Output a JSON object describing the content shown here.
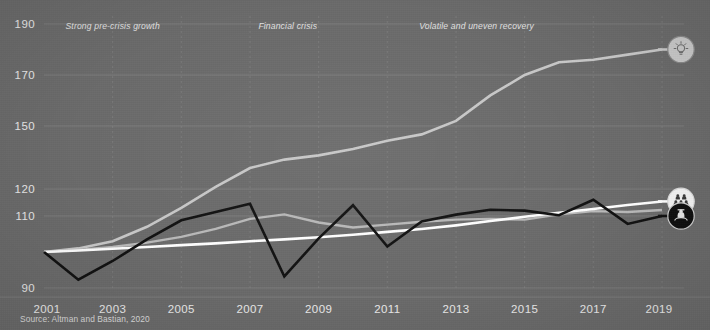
{
  "source": {
    "text": "Source: Altman and Bastian, 2020"
  },
  "annotations": [
    {
      "label": "Strong pre-crisis growth",
      "x_year": 2003.0,
      "y_value": 188.0
    },
    {
      "label": "Financial crisis",
      "x_year": 2008.1,
      "y_value": 188.0
    },
    {
      "label": "Volatile and uneven recovery",
      "x_year": 2013.6,
      "y_value": 188.0
    }
  ],
  "icons": [
    {
      "name": "lightbulb-icon",
      "glyph": "bulb",
      "series": "productivity",
      "fill": "#c9c9c9",
      "stroke": "#8a8a8a",
      "symbol_color": "#6f6f6f"
    },
    {
      "name": "people-group-icon",
      "glyph": "people",
      "series": "compensation",
      "fill": "#f4f4f4",
      "stroke": "#dddddd",
      "symbol_color": "#3a3a3a"
    },
    {
      "name": "worker-person-icon",
      "glyph": "worker",
      "series": "wages",
      "fill": "#101010",
      "stroke": "#cfcfcf",
      "symbol_color": "#e8e8e8"
    }
  ],
  "chart_data": {
    "type": "line",
    "title": "",
    "subtitle": "",
    "xlabel": "",
    "ylabel": "",
    "grid": true,
    "legend_position": "end-of-line-icons",
    "background_color": "#6b6b6b",
    "x": [
      2001,
      2002,
      2003,
      2004,
      2005,
      2006,
      2007,
      2008,
      2009,
      2010,
      2011,
      2012,
      2013,
      2014,
      2015,
      2016,
      2017,
      2018,
      2019
    ],
    "xticks": [
      2001,
      2003,
      2005,
      2007,
      2009,
      2011,
      2013,
      2015,
      2017,
      2019
    ],
    "xlim": [
      2001,
      2019
    ],
    "yticks": [
      90,
      110,
      120,
      150,
      170,
      190
    ],
    "ytick_labels": [
      "90",
      "110",
      "120",
      "150",
      "170",
      "190"
    ],
    "ylim": [
      88,
      192
    ],
    "y_scale": "compressed-nonlinear",
    "series": [
      {
        "name": "productivity",
        "label": "Productivity",
        "color": "#c8c8c8",
        "width": 2.6,
        "values": [
          100,
          101,
          103,
          107,
          113,
          121,
          130,
          134,
          136,
          139,
          143,
          146,
          152,
          162,
          170,
          175,
          176,
          178,
          180
        ]
      },
      {
        "name": "compensation",
        "label": "Compensation",
        "color": "#ffffff",
        "width": 2.6,
        "values": [
          100,
          100.4,
          100.9,
          101.4,
          101.9,
          102.4,
          103.0,
          103.5,
          104.1,
          104.8,
          105.6,
          106.4,
          107.4,
          108.6,
          109.8,
          111.2,
          112.6,
          114.1,
          115.4
        ]
      },
      {
        "name": "wages",
        "label": "Median wages",
        "color": "#111111",
        "width": 2.6,
        "values": [
          100,
          92.3,
          97.5,
          103.5,
          108.8,
          111.5,
          114.5,
          93.2,
          103.8,
          114.0,
          101.5,
          108.5,
          110.5,
          112.3,
          112.0,
          110.3,
          116.0,
          107.8,
          110.0
        ]
      },
      {
        "name": "secondary-gray",
        "label": "Secondary gray",
        "color": "#b9b9b9",
        "width": 2.4,
        "values": [
          100,
          100.6,
          101.4,
          102.6,
          104.2,
          106.4,
          109.2,
          110.6,
          108.2,
          106.8,
          107.6,
          108.4,
          109.0,
          109.2,
          109.0,
          110.6,
          111.8,
          111.5,
          112.2
        ]
      }
    ]
  }
}
